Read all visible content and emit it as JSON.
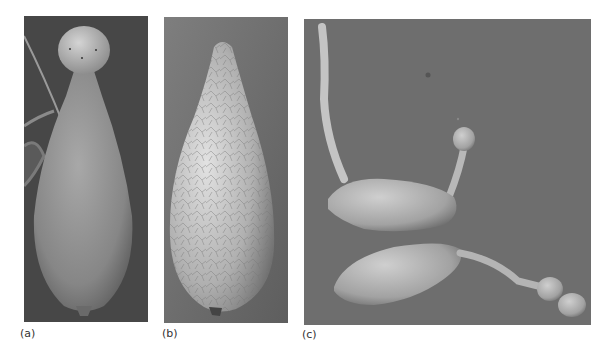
{
  "figure": {
    "panels": [
      {
        "id": "a",
        "label": "(a)",
        "subject": "spore with spherical head on tapered body",
        "background": "#4a4a4a"
      },
      {
        "id": "b",
        "label": "(b)",
        "subject": "pear-shaped spore with wrinkled reticulate surface",
        "background": "#7a7a7a"
      },
      {
        "id": "c",
        "label": "(c)",
        "subject": "two germinating spores with germ tubes",
        "background": "#6f6f6f"
      }
    ]
  }
}
